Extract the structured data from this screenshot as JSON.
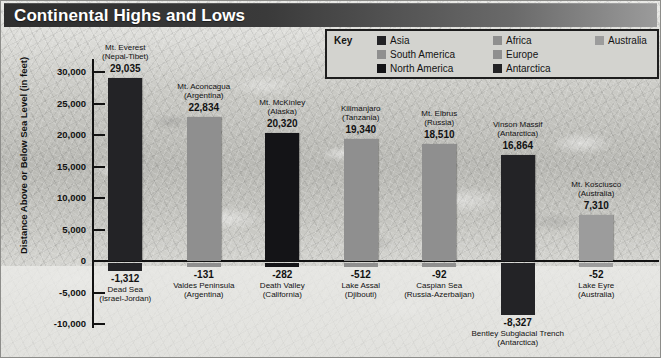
{
  "header": {
    "title": "Continental Highs and Lows"
  },
  "legend": {
    "title": "Key",
    "columns": [
      [
        {
          "label": "Asia",
          "color": "#232326"
        },
        {
          "label": "South America",
          "color": "#8f8f8f"
        },
        {
          "label": "North America",
          "color": "#141417"
        }
      ],
      [
        {
          "label": "Africa",
          "color": "#8f8f8f"
        },
        {
          "label": "Europe",
          "color": "#8f8f8f"
        },
        {
          "label": "Antarctica",
          "color": "#232326"
        }
      ],
      [
        {
          "label": "Australia",
          "color": "#9c9c9c"
        }
      ]
    ]
  },
  "axis": {
    "ylabel": "Distance Above or Below Sea Level (in feet)",
    "ticks": [
      "30,000",
      "25,000",
      "20,000",
      "15,000",
      "10,000",
      "5,000",
      "0",
      "-5,000",
      "-10,000"
    ]
  },
  "chart_data": {
    "type": "bar",
    "title": "Continental Highs and Lows",
    "xlabel": "",
    "ylabel": "Distance Above or Below Sea Level (in feet)",
    "ylim": [
      -10000,
      30000
    ],
    "ytick_interval": 5000,
    "grid": false,
    "legend_position": "top-right",
    "legend_entries": [
      "Asia",
      "South America",
      "North America",
      "Africa",
      "Europe",
      "Antarctica",
      "Australia"
    ],
    "series": [
      {
        "name": "Highest point",
        "values": [
          29035,
          22834,
          20320,
          19340,
          18510,
          16864,
          7310
        ]
      },
      {
        "name": "Lowest point",
        "values": [
          -1312,
          -131,
          -282,
          -512,
          -92,
          -8327,
          -52
        ]
      }
    ],
    "categories": [
      "Asia",
      "South America",
      "North America",
      "Africa",
      "Europe",
      "Antarctica",
      "Australia"
    ],
    "highs": [
      {
        "name": "Mt. Everest",
        "region": "(Nepal-Tibet)",
        "value": 29035,
        "value_label": "29,035",
        "continent": "Asia",
        "color": "#232326"
      },
      {
        "name": "Mt. Aconcagua",
        "region": "(Argentina)",
        "value": 22834,
        "value_label": "22,834",
        "continent": "South America",
        "color": "#8f8f8f"
      },
      {
        "name": "Mt. McKinley",
        "region": "(Alaska)",
        "value": 20320,
        "value_label": "20,320",
        "continent": "North America",
        "color": "#141417"
      },
      {
        "name": "Kilimanjaro",
        "region": "(Tanzania)",
        "value": 19340,
        "value_label": "19,340",
        "continent": "Africa",
        "color": "#8f8f8f"
      },
      {
        "name": "Mt. Elbrus",
        "region": "(Russia)",
        "value": 18510,
        "value_label": "18,510",
        "continent": "Europe",
        "color": "#8f8f8f"
      },
      {
        "name": "Vinson Massif",
        "region": "(Antarctica)",
        "value": 16864,
        "value_label": "16,864",
        "continent": "Antarctica",
        "color": "#232326"
      },
      {
        "name": "Mt. Kosciusco",
        "region": "(Australia)",
        "value": 7310,
        "value_label": "7,310",
        "continent": "Australia",
        "color": "#9c9c9c"
      }
    ],
    "lows": [
      {
        "name": "Dead Sea",
        "region": "(Israel-Jordan)",
        "value": -1312,
        "value_label": "-1,312",
        "continent": "Asia",
        "color": "#232326"
      },
      {
        "name": "Valdes Peninsula",
        "region": "(Argentina)",
        "value": -131,
        "value_label": "-131",
        "continent": "South America",
        "color": "#8f8f8f"
      },
      {
        "name": "Death Valley",
        "region": "(California)",
        "value": -282,
        "value_label": "-282",
        "continent": "North America",
        "color": "#141417"
      },
      {
        "name": "Lake Assal",
        "region": "(Djibouti)",
        "value": -512,
        "value_label": "-512",
        "continent": "Africa",
        "color": "#8f8f8f"
      },
      {
        "name": "Caspian Sea",
        "region": "(Russia-Azerbaijan)",
        "value": -92,
        "value_label": "-92",
        "continent": "Europe",
        "color": "#8f8f8f"
      },
      {
        "name": "Bentley Subglacial Trench",
        "region": "(Antarctica)",
        "value": -8327,
        "value_label": "-8,327",
        "continent": "Antarctica",
        "color": "#232326"
      },
      {
        "name": "Lake Eyre",
        "region": "(Australia)",
        "value": -52,
        "value_label": "-52",
        "continent": "Australia",
        "color": "#9c9c9c"
      }
    ]
  }
}
